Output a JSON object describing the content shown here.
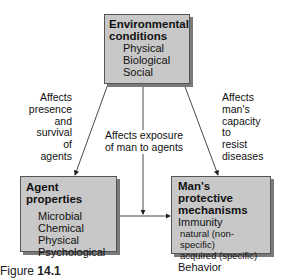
{
  "env_box": {
    "title_line1": "Environmental",
    "title_line2": "conditions",
    "items": [
      "Physical",
      "Biological",
      "Social"
    ]
  },
  "agent_box": {
    "title": "Agent properties",
    "items": [
      "Microbial",
      "Chemical",
      "Physical",
      "Psychological"
    ]
  },
  "man_box": {
    "title_line1": "Man's protective",
    "title_line2": "mechanisms",
    "items": [
      "Immunity",
      "natural (non-specific)",
      "acquired (specific)",
      "Behavior"
    ]
  },
  "labels": {
    "left": [
      "Affects",
      "presence",
      "and",
      "survival",
      "of",
      "agents"
    ],
    "center": [
      "Affects exposure",
      "of man to agents"
    ],
    "right": [
      "Affects",
      "man's",
      "capacity",
      "to",
      "resist",
      "diseases"
    ]
  },
  "caption": {
    "prefix": "Figure",
    "number": "14.1"
  }
}
